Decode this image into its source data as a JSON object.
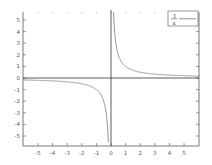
{
  "chart_data": {
    "type": "line",
    "title": "",
    "xlabel": "",
    "ylabel": "",
    "xlim": [
      -6,
      6
    ],
    "ylim": [
      -5.7,
      5.7
    ],
    "x_ticks": [
      -5,
      -4,
      -3,
      -2,
      -1,
      0,
      1,
      2,
      3,
      4,
      5
    ],
    "y_ticks": [
      -5,
      -4,
      -3,
      -2,
      -1,
      0,
      1,
      2,
      3,
      4,
      5
    ],
    "x_tick_labels": [
      "-5",
      "-4",
      "-3",
      "-2",
      "-1",
      "0",
      "1",
      "2",
      "3",
      "4",
      "5"
    ],
    "y_tick_labels": [
      "-5",
      "-4",
      "-3",
      "-2",
      "-1",
      "0",
      "1",
      "2",
      "3",
      "4",
      "5"
    ],
    "grid": false,
    "axes_through_origin": true,
    "legend_position": "top-right",
    "series": [
      {
        "name": "1/x",
        "legend_numerator": "1",
        "legend_denominator": "x",
        "function": "1/x",
        "color": "#888888",
        "x": [
          -6,
          -5,
          -4,
          -3,
          -2,
          -1,
          -0.5,
          -0.25,
          -0.175,
          0.175,
          0.25,
          0.5,
          1,
          2,
          3,
          4,
          5,
          6
        ],
        "y": [
          -0.167,
          -0.2,
          -0.25,
          -0.333,
          -0.5,
          -1,
          -2,
          -4,
          -5.7,
          5.7,
          4,
          2,
          1,
          0.5,
          0.333,
          0.25,
          0.2,
          0.167
        ]
      }
    ],
    "colors": {
      "axis": "#333333",
      "curve": "#888888",
      "tick_label": "#555555"
    }
  }
}
